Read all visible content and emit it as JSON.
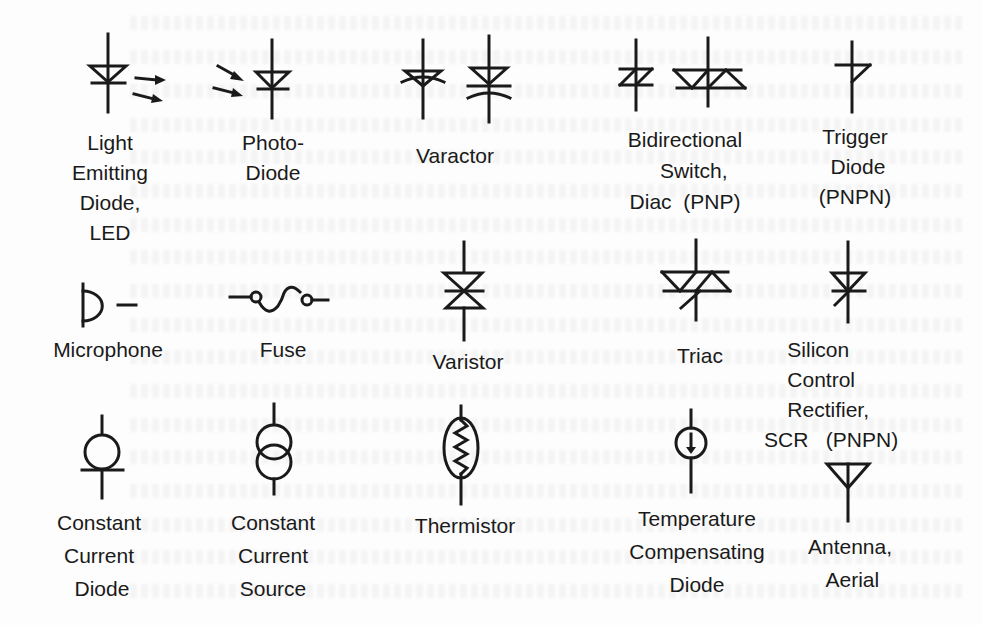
{
  "page": {
    "background": "#fdfdfd",
    "ink_color": "#1a1a1a"
  },
  "symbols": [
    {
      "id": "led",
      "icon": "led-icon",
      "label_lines": [
        "Light",
        "Emitting",
        "Diode,",
        "LED"
      ]
    },
    {
      "id": "photodiode",
      "icon": "photodiode-icon",
      "label_lines": [
        "Photo-",
        "Diode"
      ]
    },
    {
      "id": "varactor",
      "icon": "varactor-icon",
      "label_lines": [
        "Varactor"
      ]
    },
    {
      "id": "diac",
      "icon": "diac-icon",
      "label_lines": [
        "Bidirectional",
        "Switch,",
        "Diac  (PNP)"
      ]
    },
    {
      "id": "trigger-diode",
      "icon": "trigger-diode-icon",
      "label_lines": [
        "Trigger",
        "Diode",
        "(PNPN)"
      ]
    },
    {
      "id": "microphone",
      "icon": "microphone-icon",
      "label_lines": [
        "Microphone"
      ]
    },
    {
      "id": "fuse",
      "icon": "fuse-icon",
      "label_lines": [
        "Fuse"
      ]
    },
    {
      "id": "varistor",
      "icon": "varistor-icon",
      "label_lines": [
        "Varistor"
      ]
    },
    {
      "id": "triac",
      "icon": "triac-icon",
      "label_lines": [
        "Triac"
      ]
    },
    {
      "id": "scr",
      "icon": "scr-icon",
      "label_lines": [
        "Silicon",
        "Control",
        "Rectifier,",
        "SCR   (PNPN)"
      ]
    },
    {
      "id": "constant-current-diode",
      "icon": "constant-current-diode-icon",
      "label_lines": [
        "Constant",
        "Current",
        "Diode"
      ]
    },
    {
      "id": "constant-current-source",
      "icon": "constant-current-source-icon",
      "label_lines": [
        "Constant",
        "Current",
        "Source"
      ]
    },
    {
      "id": "thermistor",
      "icon": "thermistor-icon",
      "label_lines": [
        "Thermistor"
      ]
    },
    {
      "id": "temp-comp-diode",
      "icon": "temperature-compensating-diode-icon",
      "label_lines": [
        "Temperature",
        "Compensating",
        "Diode"
      ]
    },
    {
      "id": "antenna",
      "icon": "antenna-icon",
      "label_lines": [
        "Antenna,",
        "Aerial"
      ]
    }
  ],
  "labels": {
    "led": "Light\nEmitting\nDiode,\nLED",
    "photodiode": "Photo-\nDiode",
    "varactor": "Varactor",
    "diac": "Bidirectional\n   Switch,\nDiac  (PNP)",
    "trigger": "Trigger\n Diode\n(PNPN)",
    "microphone": "Microphone",
    "fuse": "Fuse",
    "varistor": "Varistor",
    "triac": "Triac",
    "scr": "    Silicon\n    Control\n    Rectifier,\nSCR   (PNPN)",
    "ccd": "Constant\nCurrent\n Diode",
    "ccs": "Constant\nCurrent\nSource",
    "thermistor": "Thermistor",
    "tcd": "Temperature\nCompensating\nDiode",
    "antenna": "Antenna,\n Aerial"
  }
}
